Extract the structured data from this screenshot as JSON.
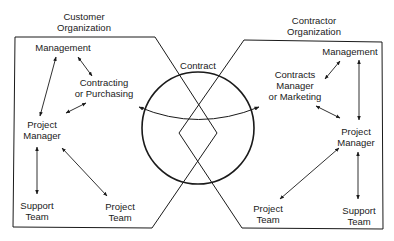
{
  "diagram": {
    "customer": {
      "title_line1": "Customer",
      "title_line2": "Organization",
      "nodes": {
        "management": "Management",
        "contracting_line1": "Contracting",
        "contracting_line2": "or Purchasing",
        "pm_line1": "Project",
        "pm_line2": "Manager",
        "support_line1": "Support",
        "support_line2": "Team",
        "team_line1": "Project",
        "team_line2": "Team"
      }
    },
    "contractor": {
      "title_line1": "Contractor",
      "title_line2": "Organization",
      "nodes": {
        "management": "Management",
        "contracts_line1": "Contracts",
        "contracts_line2": "Manager",
        "contracts_line3": "or Marketing",
        "pm_line1": "Project",
        "pm_line2": "Manager",
        "team_line1": "Project",
        "team_line2": "Team",
        "support_line1": "Support",
        "support_line2": "Team"
      }
    },
    "center": {
      "label": "Contract"
    },
    "colors": {
      "line": "#1a1a1a",
      "background": "#ffffff"
    }
  }
}
